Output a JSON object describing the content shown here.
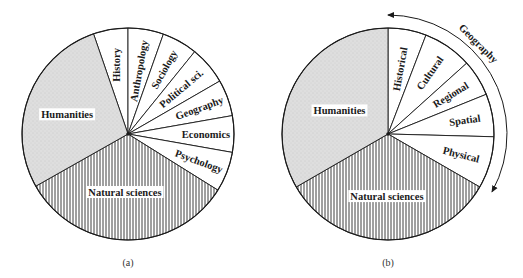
{
  "figure": {
    "panels": [
      {
        "id": "a",
        "caption": "(a)",
        "center": [
          128,
          134
        ],
        "radius": 106,
        "slices": [
          {
            "label": "History",
            "start": 90,
            "end": 109,
            "fill": "white",
            "label_r": 70,
            "rotate": -90
          },
          {
            "label": "Anthropology",
            "start": 70.5,
            "end": 90,
            "fill": "white",
            "label_r": 64,
            "rotate": -80
          },
          {
            "label": "Sociology",
            "start": 51,
            "end": 70.5,
            "fill": "white",
            "label_r": 74,
            "rotate": -61
          },
          {
            "label": "Political sci.",
            "start": 30,
            "end": 51,
            "fill": "white",
            "label_r": 70,
            "rotate": -40
          },
          {
            "label": "Geography",
            "start": 10,
            "end": 30,
            "fill": "white",
            "label_r": 76,
            "rotate": -20
          },
          {
            "label": "Economics",
            "start": -10,
            "end": 10,
            "fill": "white",
            "label_r": 78,
            "rotate": 0
          },
          {
            "label": "Psychology",
            "start": -32,
            "end": -10,
            "fill": "white",
            "label_r": 76,
            "rotate": 20
          },
          {
            "label": "Natural sciences",
            "start": -150.5,
            "end": -32,
            "fill": "hatch",
            "label_r": 58,
            "label_angle": -93,
            "rotate": 0
          },
          {
            "label": "Humanities",
            "start": 109,
            "end": 209.5,
            "fill": "stipple",
            "label_r": 64,
            "label_angle": 162,
            "rotate": 0
          }
        ]
      },
      {
        "id": "b",
        "caption": "(b)",
        "center": [
          388,
          134
        ],
        "radius": 106,
        "slices": [
          {
            "label": "Historical",
            "start": 69,
            "end": 90,
            "fill": "white",
            "label_r": 66,
            "rotate": -80
          },
          {
            "label": "Cultural",
            "start": 42,
            "end": 69,
            "fill": "white",
            "label_r": 74,
            "rotate": -55
          },
          {
            "label": "Regional",
            "start": 22,
            "end": 42,
            "fill": "white",
            "label_r": 74,
            "rotate": -32
          },
          {
            "label": "Spatial",
            "start": -1.5,
            "end": 22,
            "fill": "white",
            "label_r": 78,
            "rotate": -8
          },
          {
            "label": "Physical",
            "start": -30,
            "end": -1.5,
            "fill": "white",
            "label_r": 76,
            "rotate": 14
          },
          {
            "label": "Natural sciences",
            "start": -150,
            "end": -30,
            "fill": "hatch",
            "label_r": 62,
            "label_angle": -91,
            "rotate": 0
          },
          {
            "label": "Humanities",
            "start": 90,
            "end": 210,
            "fill": "stipple",
            "label_r": 54,
            "label_angle": 154,
            "rotate": 0
          }
        ],
        "bracket": {
          "label": "Geography",
          "radius": 119,
          "start": 90,
          "end": -29
        }
      }
    ],
    "colors": {
      "stroke": "#1a1a1a",
      "stipple_fill": "#d9d9d9",
      "hatch_bg": "#ffffff",
      "hatch_line": "#2a2a2a",
      "label_bg": "#ffffff"
    }
  }
}
